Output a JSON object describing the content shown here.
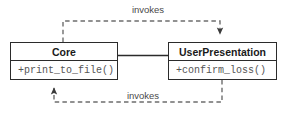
{
  "diagram": {
    "type": "uml-class-diagram",
    "canvas": {
      "width": 289,
      "height": 113,
      "background": "#ffffff"
    },
    "colors": {
      "stroke": "#2b2b2b",
      "dashed_stroke": "#6e6e6e",
      "class_name_text": "#1a1a1a",
      "member_text": "#555555",
      "label_text": "#4a4a4a",
      "fill": "#ffffff"
    },
    "classes": [
      {
        "id": "core",
        "name": "Core",
        "members": [
          "+print_to_file()"
        ]
      },
      {
        "id": "userpresentation",
        "name": "UserPresentation",
        "members": [
          "+confirm_loss()"
        ]
      }
    ],
    "relationships": [
      {
        "id": "association",
        "kind": "association",
        "style": "solid",
        "from": "core",
        "to": "userpresentation",
        "label": ""
      },
      {
        "id": "dependency-top",
        "kind": "dependency",
        "style": "dashed",
        "from": "core",
        "to": "userpresentation",
        "label": "invokes",
        "arrow": "open-down"
      },
      {
        "id": "dependency-bottom",
        "kind": "dependency",
        "style": "dashed",
        "from": "userpresentation",
        "to": "core",
        "label": "invokes",
        "arrow": "open-up"
      }
    ]
  }
}
